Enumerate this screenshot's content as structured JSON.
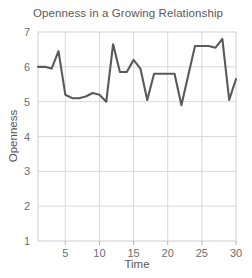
{
  "chart_data": {
    "type": "line",
    "title": "Openness in a Growing Relationship",
    "xlabel": "Time",
    "ylabel": "Openness",
    "xlim": [
      1,
      30
    ],
    "ylim": [
      1,
      7
    ],
    "grid": true,
    "legend": "none",
    "line_color": "#5a5a5a",
    "grid_color": "#d9d9d9",
    "x": [
      1,
      2,
      3,
      4,
      5,
      6,
      7,
      8,
      9,
      10,
      11,
      12,
      13,
      14,
      15,
      16,
      17,
      18,
      19,
      20,
      21,
      22,
      23,
      24,
      25,
      26,
      27,
      28,
      29,
      30
    ],
    "values": [
      6.0,
      6.0,
      5.95,
      6.45,
      5.2,
      5.1,
      5.1,
      5.15,
      5.25,
      5.2,
      5.0,
      6.65,
      5.85,
      5.85,
      6.2,
      5.95,
      5.05,
      5.8,
      5.8,
      5.8,
      5.8,
      4.9,
      5.75,
      6.6,
      6.6,
      6.6,
      6.55,
      6.8,
      5.05,
      5.65
    ],
    "xticks": [
      5,
      10,
      15,
      20,
      25,
      30
    ],
    "yticks": [
      1,
      2,
      3,
      4,
      5,
      6,
      7
    ],
    "series": [
      {
        "name": "Openness",
        "values": [
          6.0,
          6.0,
          5.95,
          6.45,
          5.2,
          5.1,
          5.1,
          5.15,
          5.25,
          5.2,
          5.0,
          6.65,
          5.85,
          5.85,
          6.2,
          5.95,
          5.05,
          5.8,
          5.8,
          5.8,
          5.8,
          4.9,
          5.75,
          6.6,
          6.6,
          6.6,
          6.55,
          6.8,
          5.05,
          5.65
        ]
      }
    ]
  },
  "axis": {
    "x_tick_labels": [
      "5",
      "10",
      "15",
      "20",
      "25",
      "30"
    ],
    "y_tick_labels": [
      "1",
      "2",
      "3",
      "4",
      "5",
      "6",
      "7"
    ],
    "x_title": "Time",
    "y_title": "Openness"
  },
  "title": "Openness in a Growing Relationship"
}
